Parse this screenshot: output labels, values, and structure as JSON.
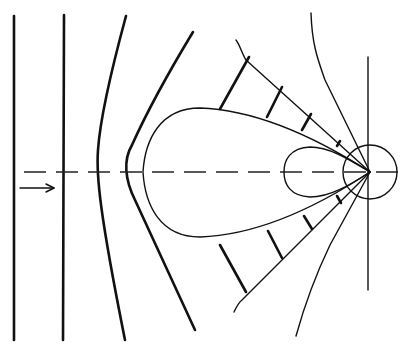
{
  "diagram": {
    "title": "",
    "colors": {
      "stroke": "#111111",
      "background": "#ffffff"
    },
    "source_point": {
      "x": 370,
      "y": 172
    },
    "wavefronts": [
      {
        "id": "wavefront-1",
        "path": "M14,16 L14,340"
      },
      {
        "id": "wavefront-2",
        "path": "M64,15 L63,340"
      },
      {
        "id": "wavefront-3",
        "path": "M126,16 C110,75 100,120 98,150 C96,175 100,215 125,340"
      },
      {
        "id": "wavefront-4",
        "path": "M193,32 C170,70 150,105 132,145 C123,160 125,180 135,200 L195,330"
      }
    ],
    "main_lobe": "M370,172 C320,140 260,110 200,108 C160,108 145,140 143,172 C145,205 160,237 200,237 C260,235 320,205 370,172",
    "back_lobe": "M370,172 C350,160 330,147 310,147 C290,148 284,160 284,172 C284,184 290,196 310,197 C330,197 350,185 370,172",
    "source_circle": {
      "cx": 370,
      "cy": 172,
      "r": 27
    },
    "vertical_axis": {
      "x": 368,
      "y1": 57,
      "y2": 290
    },
    "horizontal_axis_dashed": {
      "x1": 24,
      "x2": 400,
      "y": 172
    },
    "cone_upper": "M236,40 C240,45 242,54 246,60 L370,172",
    "cone_lower": "M370,172 L242,300 C238,303 236,308 234,312",
    "outer_upper": "M311,13 C312,45 318,60 325,80 L370,172",
    "outer_lower": "M370,172 L330,245 C318,270 306,300 296,336",
    "hatches": [
      {
        "path": "M220,109 L249,57"
      },
      {
        "path": "M267,117 L282,87"
      },
      {
        "path": "M302,130 L311,114"
      },
      {
        "path": "M337,146 L340,141"
      },
      {
        "path": "M220,245 L246,292"
      },
      {
        "path": "M268,231 L282,258"
      },
      {
        "path": "M304,216 L312,229"
      },
      {
        "path": "M337,196 L341,203"
      }
    ],
    "arrow": {
      "x1": 20,
      "x2": 54,
      "y": 188,
      "label": ""
    }
  }
}
